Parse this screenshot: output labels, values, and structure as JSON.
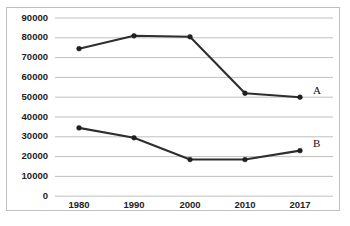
{
  "chart_data": {
    "type": "line",
    "title": "",
    "subtitle": "",
    "xlabel": "",
    "ylabel": "",
    "categories": [
      "1980",
      "1990",
      "2000",
      "2010",
      "2017"
    ],
    "series": [
      {
        "name": "A",
        "label": "A",
        "values": [
          74500,
          81000,
          80500,
          52000,
          50000
        ]
      },
      {
        "name": "B",
        "label": "B",
        "values": [
          34500,
          29500,
          18500,
          18500,
          23000
        ]
      }
    ],
    "ylim": [
      0,
      90000
    ],
    "ytick_step": 10000,
    "yticks": [
      "90000",
      "80000",
      "70000",
      "60000",
      "50000",
      "40000",
      "30000",
      "20000",
      "10000",
      "0"
    ],
    "grid": "horizontal",
    "legend": "inline-endpoint-labels",
    "line_color": "#2e2e2e",
    "grid_color": "#b9b9b9",
    "border_color": "#bfbfbf",
    "background": "#ffffff"
  },
  "caption": {
    "text": "",
    "visible": false
  }
}
